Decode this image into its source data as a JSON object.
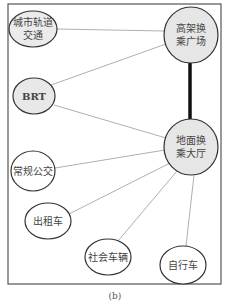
{
  "diagram": {
    "caption": "(b)",
    "frame": {
      "x": 8,
      "y": 4,
      "w": 213,
      "h": 280,
      "stroke": "#555555"
    },
    "colors": {
      "hub_fill": "#e8e8e8",
      "mode_fill": "#ffffff",
      "stroke": "#333333",
      "edge": "#9a9a9a",
      "strong_edge": "#111111"
    },
    "nodes": [
      {
        "id": "urban_rail",
        "lines": [
          "城市轨道",
          "交通"
        ],
        "cx": 33,
        "cy": 29,
        "rx": 24,
        "ry": 18,
        "fill": "#ebebeb"
      },
      {
        "id": "elevated_plaza",
        "lines": [
          "高架换",
          "乘广场"
        ],
        "cx": 191,
        "cy": 35,
        "rx": 27,
        "ry": 28,
        "fill": "#e6e6e6"
      },
      {
        "id": "brt",
        "lines": [
          "BRT"
        ],
        "cx": 34,
        "cy": 96,
        "rx": 21,
        "ry": 18,
        "fill": "#e8e8e8"
      },
      {
        "id": "ground_hall",
        "lines": [
          "地面换",
          "乘大厅"
        ],
        "cx": 191,
        "cy": 147,
        "rx": 27,
        "ry": 28,
        "fill": "#e6e6e6"
      },
      {
        "id": "regular_bus",
        "lines": [
          "常规公交"
        ],
        "cx": 33,
        "cy": 171,
        "rx": 22,
        "ry": 20,
        "fill": "#ffffff"
      },
      {
        "id": "taxi",
        "lines": [
          "出租车"
        ],
        "cx": 48,
        "cy": 221,
        "rx": 23,
        "ry": 18,
        "fill": "#ffffff"
      },
      {
        "id": "private_car",
        "lines": [
          "社会车辆"
        ],
        "cx": 108,
        "cy": 257,
        "rx": 23,
        "ry": 18,
        "fill": "#ffffff"
      },
      {
        "id": "bicycle",
        "lines": [
          "自行车"
        ],
        "cx": 183,
        "cy": 265,
        "rx": 23,
        "ry": 19,
        "fill": "#ffffff"
      }
    ],
    "edges": [
      {
        "from": "urban_rail",
        "to": "elevated_plaza",
        "x1": 57,
        "y1": 29,
        "x2": 164,
        "y2": 31,
        "strong": false
      },
      {
        "from": "brt",
        "to": "elevated_plaza",
        "x1": 51,
        "y1": 85,
        "x2": 166,
        "y2": 44,
        "strong": false
      },
      {
        "from": "brt",
        "to": "ground_hall",
        "x1": 54,
        "y1": 105,
        "x2": 166,
        "y2": 138,
        "strong": false
      },
      {
        "from": "elevated_plaza",
        "to": "ground_hall",
        "x1": 190,
        "y1": 63,
        "x2": 190,
        "y2": 119,
        "strong": true
      },
      {
        "from": "regular_bus",
        "to": "ground_hall",
        "x1": 55,
        "y1": 168,
        "x2": 165,
        "y2": 150,
        "strong": false
      },
      {
        "from": "taxi",
        "to": "ground_hall",
        "x1": 69,
        "y1": 214,
        "x2": 170,
        "y2": 163,
        "strong": false
      },
      {
        "from": "private_car",
        "to": "ground_hall",
        "x1": 118,
        "y1": 241,
        "x2": 177,
        "y2": 171,
        "strong": false
      },
      {
        "from": "bicycle",
        "to": "ground_hall",
        "x1": 186,
        "y1": 246,
        "x2": 194,
        "y2": 175,
        "strong": false
      }
    ]
  }
}
